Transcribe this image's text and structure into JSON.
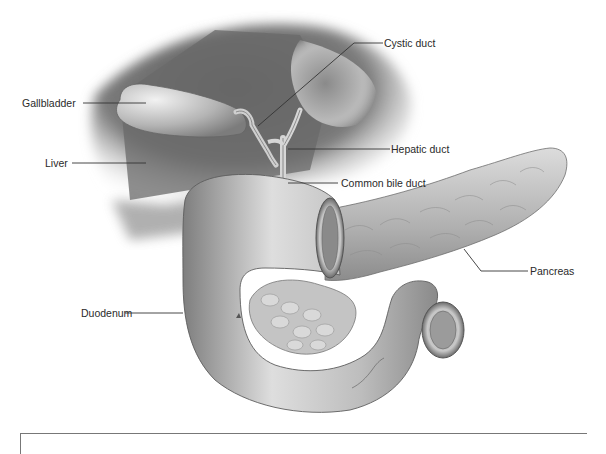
{
  "figure": {
    "labels": [
      {
        "id": "gallbladder",
        "text": "Gallbladder"
      },
      {
        "id": "liver",
        "text": "Liver"
      },
      {
        "id": "cystic-duct",
        "text": "Cystic duct"
      },
      {
        "id": "hepatic-duct",
        "text": "Hepatic duct"
      },
      {
        "id": "common-bile-duct",
        "text": "Common bile duct"
      },
      {
        "id": "pancreas",
        "text": "Pancreas"
      },
      {
        "id": "duodenum",
        "text": "Duodenum"
      }
    ]
  },
  "colors": {
    "background": "#ffffff",
    "organ_dark": "#6e6e6e",
    "organ_mid": "#9a9a9a",
    "organ_light": "#d2d2d2",
    "leader_line": "#333333",
    "label_text": "#2a2a2a",
    "frame": "#777777"
  }
}
